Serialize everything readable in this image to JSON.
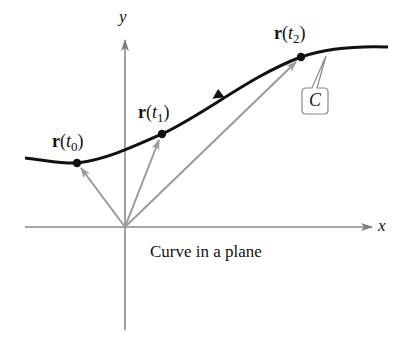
{
  "figure": {
    "caption": "Curve in a plane",
    "axes": {
      "x_label": "x",
      "y_label": "y"
    },
    "curve_label": "C",
    "points": [
      {
        "name": "r",
        "var": "t",
        "sub": "0",
        "open": "(",
        "close": ")"
      },
      {
        "name": "r",
        "var": "t",
        "sub": "1",
        "open": "(",
        "close": ")"
      },
      {
        "name": "r",
        "var": "t",
        "sub": "2",
        "open": "(",
        "close": ")"
      }
    ]
  },
  "colors": {
    "curve": "#111111",
    "axis": "#8a8a8a",
    "vector": "#9a9a9a",
    "callout_border": "#888888"
  }
}
